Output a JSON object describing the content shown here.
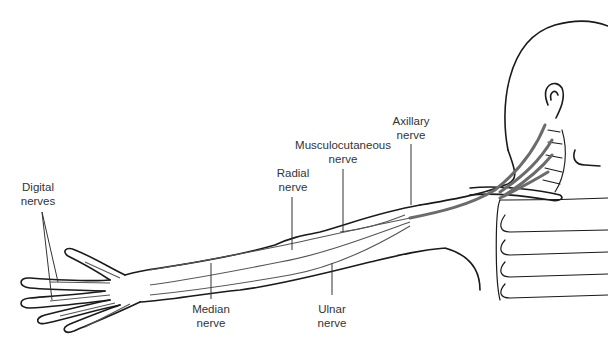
{
  "diagram": {
    "colors": {
      "outline": "#1a1a1a",
      "nerve_fill": "#6b6b6b",
      "leader": "#333333",
      "background": "#ffffff"
    },
    "labels": [
      {
        "id": "digital",
        "line1": "Digital",
        "line2": "nerves"
      },
      {
        "id": "radial",
        "line1": "Radial",
        "line2": "nerve"
      },
      {
        "id": "musculocutaneous",
        "line1": "Musculocutaneous",
        "line2": "nerve"
      },
      {
        "id": "axillary",
        "line1": "Axillary",
        "line2": "nerve"
      },
      {
        "id": "median",
        "line1": "Median",
        "line2": "nerve"
      },
      {
        "id": "ulnar",
        "line1": "Ulnar",
        "line2": "nerve"
      }
    ]
  }
}
